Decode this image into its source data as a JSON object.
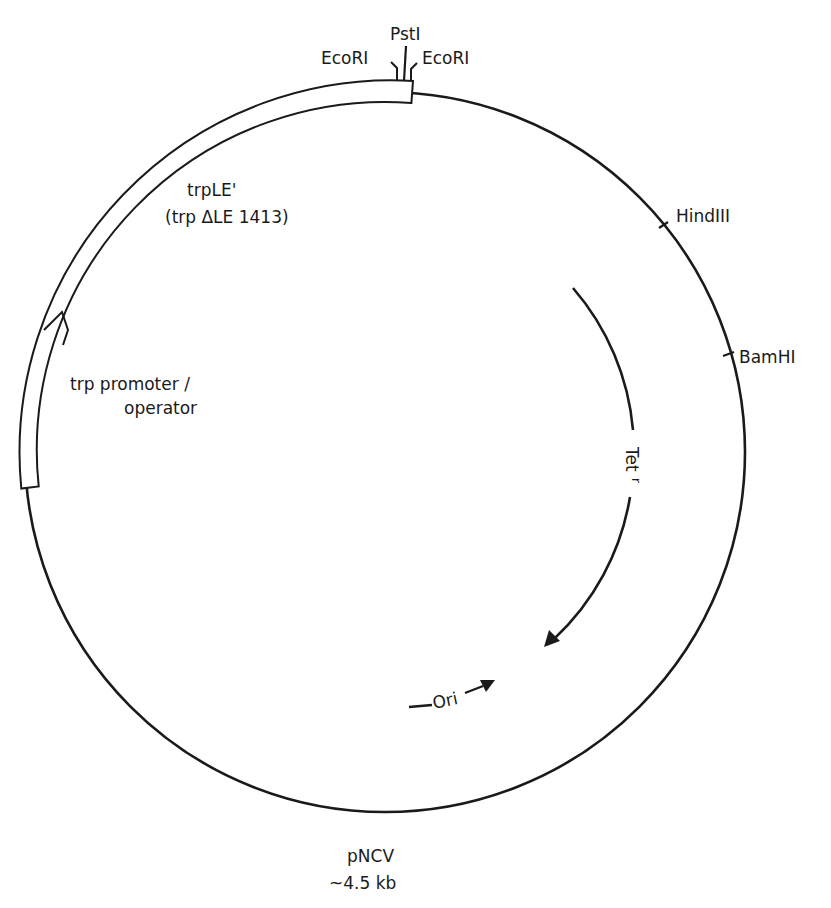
{
  "plasmid": {
    "name": "pNCV",
    "size": "~4.5 kb"
  },
  "restriction_sites": [
    {
      "label": "PstI"
    },
    {
      "label": "EcoRI",
      "position": "left"
    },
    {
      "label": "EcoRI",
      "position": "right"
    },
    {
      "label": "HindIII"
    },
    {
      "label": "BamHI"
    }
  ],
  "regions": {
    "trpLE": {
      "label": "trpLE'",
      "sublabel": "(trp ΔLE 1413)"
    },
    "promoter": {
      "line1": "trp promoter /",
      "line2": "operator"
    }
  },
  "genes": {
    "tet": {
      "label": "Tet",
      "superscript": "r"
    },
    "ori": {
      "label": "Ori"
    }
  },
  "colors": {
    "line": "#1a1a1a",
    "background": "#ffffff"
  }
}
